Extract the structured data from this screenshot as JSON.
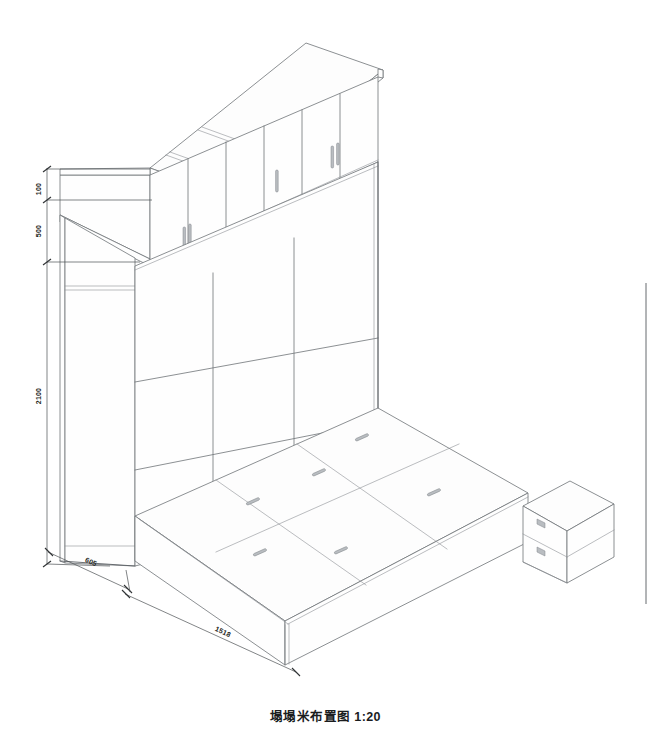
{
  "drawing": {
    "title": "塌塌米布置图 1:20",
    "scale": "1:20",
    "type": "isometric-furniture-layout",
    "line_color": "#6f7377",
    "text_color": "#1c1e20",
    "background": "#ffffff"
  },
  "dimensions": {
    "top_gap": "100",
    "upper_cabinet_height": "500",
    "total_height": "2100",
    "depth": "605",
    "width": "1518"
  },
  "components": {
    "upper_cabinet": {
      "name": "上吊柜",
      "door_count": 4,
      "handle_count": 6
    },
    "back_wall": {
      "name": "背景墙板",
      "columns": 3,
      "rows": 2
    },
    "side_panel": {
      "name": "侧板"
    },
    "tatami_platform": {
      "name": "塌塌米地台",
      "panel_count": 6,
      "pull_count": 6
    },
    "nightstand": {
      "name": "床头柜",
      "drawer_count": 2
    }
  },
  "labels": {
    "dim_100": "100",
    "dim_500": "500",
    "dim_2100": "2100",
    "dim_605": "605",
    "dim_1518": "1518"
  }
}
